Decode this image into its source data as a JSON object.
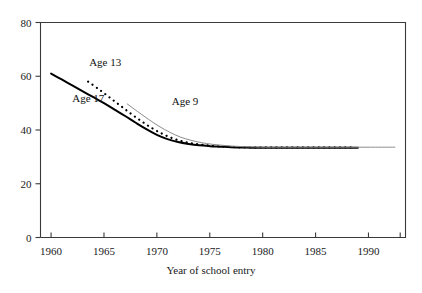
{
  "chart_data": {
    "type": "line",
    "title": "",
    "xlabel": "Year of school entry",
    "ylabel": "",
    "xlim": [
      1959,
      1993.5
    ],
    "ylim": [
      0,
      80
    ],
    "grid": false,
    "legend_position": "inline-annotations",
    "xticks": [
      1960,
      1965,
      1970,
      1975,
      1980,
      1985,
      1990
    ],
    "xtick_labels": [
      "1960",
      "1965",
      "1970",
      "1975",
      "1980",
      "1985",
      "1990"
    ],
    "yticks": [
      0,
      20,
      40,
      60,
      80
    ],
    "ytick_labels": [
      "0",
      "20",
      "40",
      "60",
      "80"
    ],
    "series": [
      {
        "name": "Age 17",
        "style": "solid",
        "color": "#000000",
        "width": 2.0,
        "label_x": 1962.0,
        "label_y": 51.5,
        "x": [
          1960,
          1961,
          1962,
          1963,
          1964,
          1965,
          1966,
          1967,
          1968,
          1969,
          1970,
          1971,
          1972,
          1973,
          1974,
          1975,
          1976,
          1977,
          1978,
          1979,
          1980,
          1981,
          1982,
          1983,
          1984,
          1985,
          1986,
          1987,
          1988,
          1989
        ],
        "y": [
          61.0,
          58.8,
          56.6,
          54.4,
          52.2,
          50.0,
          47.6,
          45.2,
          42.7,
          40.3,
          38.2,
          36.6,
          35.5,
          34.8,
          34.3,
          34.0,
          33.8,
          33.6,
          33.5,
          33.4,
          33.4,
          33.4,
          33.4,
          33.4,
          33.4,
          33.4,
          33.4,
          33.4,
          33.4,
          33.4
        ]
      },
      {
        "name": "Age 13",
        "style": "dotted",
        "color": "#000000",
        "width": 2.2,
        "label_x": 1963.6,
        "label_y": 65.0,
        "x": [
          1963.5,
          1964.5,
          1965.5,
          1966.5,
          1967.5,
          1968.5,
          1969.5,
          1970.5,
          1971.5,
          1972.5,
          1973.5,
          1974.5,
          1975.5,
          1976.5,
          1977.5,
          1978.5,
          1979.5,
          1980.5,
          1981.5,
          1982.5,
          1983.5,
          1984.5,
          1985.5,
          1986.5,
          1987.5,
          1988.5
        ],
        "y": [
          58.0,
          55.2,
          52.2,
          49.2,
          46.2,
          43.4,
          40.8,
          38.6,
          36.9,
          35.7,
          34.9,
          34.4,
          34.0,
          33.8,
          33.6,
          33.5,
          33.5,
          33.5,
          33.5,
          33.5,
          33.5,
          33.5,
          33.5,
          33.5,
          33.5,
          33.5
        ]
      },
      {
        "name": "Age 9",
        "style": "solid",
        "color": "#8c8c8c",
        "width": 1.0,
        "label_x": 1971.4,
        "label_y": 50.5,
        "x": [
          1967.2,
          1968.2,
          1969.2,
          1970.2,
          1971.2,
          1972.2,
          1973.2,
          1974.2,
          1975.2,
          1976.2,
          1977.2,
          1978.2,
          1979.2,
          1980.2,
          1981.2,
          1982.2,
          1983.2,
          1984.2,
          1985.2,
          1986.2,
          1987.2,
          1988.2,
          1989.2,
          1990.2,
          1991.2,
          1992.5
        ],
        "y": [
          49.7,
          46.8,
          44.0,
          41.4,
          39.2,
          37.4,
          36.2,
          35.3,
          34.7,
          34.3,
          34.0,
          33.8,
          33.7,
          33.6,
          33.6,
          33.6,
          33.6,
          33.6,
          33.6,
          33.6,
          33.6,
          33.6,
          33.6,
          33.6,
          33.6,
          33.6
        ]
      }
    ]
  },
  "axes": {
    "frame_color": "#3a3a3a",
    "tick_color": "#3a3a3a"
  }
}
